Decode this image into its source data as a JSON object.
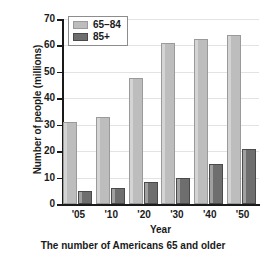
{
  "chart_data": {
    "type": "bar",
    "title": "",
    "caption": "The number of Americans 65 and older",
    "xlabel": "Year",
    "ylabel": "Number of people (millions)",
    "categories": [
      "'05",
      "'10",
      "'20",
      "'30",
      "'40",
      "'50"
    ],
    "series": [
      {
        "name": "65–84",
        "color": "#bdbdbd",
        "values": [
          31,
          33,
          47.5,
          61,
          62.5,
          64
        ]
      },
      {
        "name": "85+",
        "color": "#6e6e6e",
        "values": [
          5,
          6,
          8.5,
          10,
          15,
          21
        ]
      }
    ],
    "ylim": [
      0,
      70
    ],
    "ytick_values": [
      0,
      10,
      20,
      30,
      40,
      50,
      60,
      70
    ],
    "ytick_labels": [
      "0",
      "10",
      "20",
      "30",
      "40",
      "50",
      "60",
      "70"
    ],
    "grid": true,
    "legend_position": "top-left"
  },
  "legend": {
    "entries": [
      {
        "label": "65–84"
      },
      {
        "label": "85+"
      }
    ]
  }
}
